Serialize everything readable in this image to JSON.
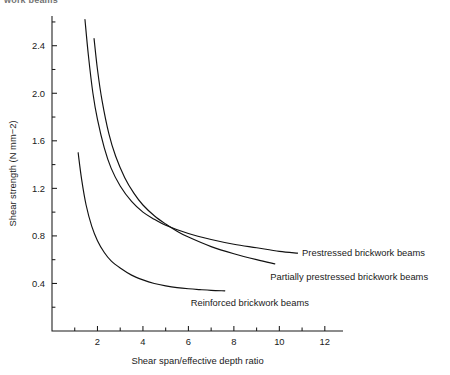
{
  "figure": {
    "clipped_heading": "work beams"
  },
  "chart_data": {
    "type": "line",
    "title": "",
    "xlabel": "Shear span/effective depth ratio",
    "ylabel": "Shear strength (N mm−2)",
    "xlim": [
      0,
      12.8
    ],
    "ylim": [
      0,
      2.65
    ],
    "xticks": [
      2,
      4,
      6,
      8,
      10,
      12
    ],
    "xticklabels": [
      "2",
      "4",
      "6",
      "8",
      "10",
      "12"
    ],
    "xminorticks": [
      1,
      3,
      5,
      7,
      9,
      11
    ],
    "yticks": [
      0.4,
      0.8,
      1.2,
      1.6,
      2.0,
      2.4
    ],
    "yticklabels": [
      "0.4",
      "0.8",
      "1.2",
      "1.6",
      "2.0",
      "2.4"
    ],
    "yminorticks": [
      0.2,
      0.6,
      1.0,
      1.4,
      1.8,
      2.2,
      2.6
    ],
    "grid": false,
    "legend": "inline-right-annotations",
    "series": [
      {
        "name": "Prestressed brickwork beams",
        "label_x": 11.0,
        "label_y": 0.66,
        "points": [
          [
            1.45,
            2.62
          ],
          [
            1.6,
            2.32
          ],
          [
            1.8,
            2.0
          ],
          [
            2.0,
            1.78
          ],
          [
            2.3,
            1.54
          ],
          [
            2.6,
            1.37
          ],
          [
            3.0,
            1.22
          ],
          [
            3.5,
            1.09
          ],
          [
            4.0,
            1.0
          ],
          [
            4.5,
            0.94
          ],
          [
            5.0,
            0.89
          ],
          [
            6.0,
            0.82
          ],
          [
            7.0,
            0.77
          ],
          [
            8.0,
            0.73
          ],
          [
            9.0,
            0.7
          ],
          [
            10.0,
            0.67
          ],
          [
            10.8,
            0.655
          ]
        ]
      },
      {
        "name": "Partially prestressed brickwork beams",
        "label_x": 9.6,
        "label_y": 0.46,
        "points": [
          [
            1.85,
            2.46
          ],
          [
            2.0,
            2.2
          ],
          [
            2.2,
            1.94
          ],
          [
            2.5,
            1.66
          ],
          [
            2.8,
            1.47
          ],
          [
            3.2,
            1.29
          ],
          [
            3.6,
            1.16
          ],
          [
            4.0,
            1.06
          ],
          [
            4.5,
            0.97
          ],
          [
            5.0,
            0.9
          ],
          [
            5.5,
            0.84
          ],
          [
            6.0,
            0.79
          ],
          [
            7.0,
            0.71
          ],
          [
            8.0,
            0.65
          ],
          [
            9.0,
            0.6
          ],
          [
            9.8,
            0.565
          ]
        ]
      },
      {
        "name": "Reinforced brickwork beams",
        "label_x": 6.1,
        "label_y": 0.24,
        "points": [
          [
            1.15,
            1.5
          ],
          [
            1.3,
            1.28
          ],
          [
            1.5,
            1.06
          ],
          [
            1.75,
            0.88
          ],
          [
            2.0,
            0.76
          ],
          [
            2.3,
            0.66
          ],
          [
            2.6,
            0.59
          ],
          [
            3.0,
            0.53
          ],
          [
            3.5,
            0.47
          ],
          [
            4.0,
            0.43
          ],
          [
            4.5,
            0.4
          ],
          [
            5.0,
            0.38
          ],
          [
            5.5,
            0.365
          ],
          [
            6.0,
            0.355
          ],
          [
            6.5,
            0.348
          ],
          [
            7.0,
            0.342
          ],
          [
            7.6,
            0.338
          ]
        ]
      }
    ]
  }
}
